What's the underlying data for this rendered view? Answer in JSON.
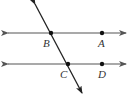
{
  "diagram": {
    "colors": {
      "parallel_lines": "#555555",
      "transversal": "#222222",
      "points": "#111111",
      "labels": "#333333"
    },
    "points": [
      {
        "label": "B",
        "x": 51,
        "y": 33
      },
      {
        "label": "A",
        "x": 102,
        "y": 33
      },
      {
        "label": "C",
        "x": 68,
        "y": 64
      },
      {
        "label": "D",
        "x": 102,
        "y": 64
      }
    ],
    "lines": [
      {
        "name": "line-BA",
        "type": "line",
        "through": [
          "B",
          "A"
        ]
      },
      {
        "name": "line-CD",
        "type": "line",
        "through": [
          "C",
          "D"
        ]
      },
      {
        "name": "transversal-BC",
        "type": "line",
        "through": [
          "B",
          "C"
        ]
      }
    ]
  }
}
